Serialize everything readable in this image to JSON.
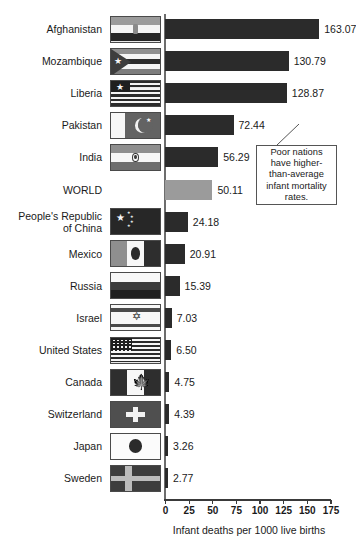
{
  "chart_data": {
    "type": "bar",
    "orientation": "horizontal",
    "title": "",
    "xlabel": "Infant deaths per 1000 live births",
    "ylabel": "",
    "xlim": [
      0,
      175
    ],
    "xticks": [
      0,
      25,
      50,
      75,
      100,
      125,
      150,
      175
    ],
    "grid": false,
    "legend": false,
    "categories": [
      "Afghanistan",
      "Mozambique",
      "Liberia",
      "Pakistan",
      "India",
      "WORLD",
      "People's Republic\nof China",
      "Mexico",
      "Russia",
      "Israel",
      "United States",
      "Canada",
      "Switzerland",
      "Japan",
      "Sweden"
    ],
    "values": [
      163.07,
      130.79,
      128.87,
      72.44,
      56.29,
      50.11,
      24.18,
      20.91,
      15.39,
      7.03,
      6.5,
      4.75,
      4.39,
      3.26,
      2.77
    ],
    "value_labels": [
      "163.07",
      "130.79",
      "128.87",
      "72.44",
      "56.29",
      "50.11",
      "24.18",
      "20.91",
      "15.39",
      "7.03",
      "6.50",
      "4.75",
      "4.39",
      "3.26",
      "2.77"
    ],
    "highlight_index": 5,
    "highlight_note": "WORLD average row drawn in lighter gray",
    "annotations": [
      {
        "text": "Poor nations have higher-than-average infant mortality rates.",
        "lines": [
          "Poor nations",
          "have higher-",
          "than-average",
          "infant mortality",
          "rates."
        ]
      }
    ],
    "colors": {
      "bar": "#2b2b2b",
      "world_bar": "#9b9b9b",
      "axis": "#3a3a3a",
      "text": "#1a1a1a",
      "background": "#ffffff"
    }
  },
  "rows": [
    {
      "label": "Afghanistan",
      "value_label": "163.07",
      "value": 163.07,
      "flag": "flag-afghanistan",
      "has_flag": true
    },
    {
      "label": "Mozambique",
      "value_label": "130.79",
      "value": 130.79,
      "flag": "flag-mozambique",
      "has_flag": true
    },
    {
      "label": "Liberia",
      "value_label": "128.87",
      "value": 128.87,
      "flag": "flag-liberia",
      "has_flag": true
    },
    {
      "label": "Pakistan",
      "value_label": "72.44",
      "value": 72.44,
      "flag": "flag-pakistan",
      "has_flag": true
    },
    {
      "label": "India",
      "value_label": "56.29",
      "value": 56.29,
      "flag": "flag-india",
      "has_flag": true
    },
    {
      "label": "WORLD",
      "value_label": "50.11",
      "value": 50.11,
      "flag": "",
      "has_flag": false
    },
    {
      "label": "People's Republic\nof China",
      "value_label": "24.18",
      "value": 24.18,
      "flag": "flag-china",
      "has_flag": true
    },
    {
      "label": "Mexico",
      "value_label": "20.91",
      "value": 20.91,
      "flag": "flag-mexico",
      "has_flag": true
    },
    {
      "label": "Russia",
      "value_label": "15.39",
      "value": 15.39,
      "flag": "flag-russia",
      "has_flag": true
    },
    {
      "label": "Israel",
      "value_label": "7.03",
      "value": 7.03,
      "flag": "flag-israel",
      "has_flag": true
    },
    {
      "label": "United States",
      "value_label": "6.50",
      "value": 6.5,
      "flag": "flag-united-states",
      "has_flag": true
    },
    {
      "label": "Canada",
      "value_label": "4.75",
      "value": 4.75,
      "flag": "flag-canada",
      "has_flag": true
    },
    {
      "label": "Switzerland",
      "value_label": "4.39",
      "value": 4.39,
      "flag": "flag-switzerland",
      "has_flag": true
    },
    {
      "label": "Japan",
      "value_label": "3.26",
      "value": 3.26,
      "flag": "flag-japan",
      "has_flag": true
    },
    {
      "label": "Sweden",
      "value_label": "2.77",
      "value": 2.77,
      "flag": "flag-sweden",
      "has_flag": true
    }
  ],
  "axis": {
    "ticks": [
      "0",
      "25",
      "50",
      "75",
      "100",
      "125",
      "150",
      "175"
    ],
    "title": "Infant deaths per 1000 live births"
  },
  "callout": {
    "line1": "Poor nations",
    "line2": "have higher-",
    "line3": "than-average",
    "line4": "infant mortality",
    "line5": "rates.",
    "full_text": "Poor nations have higher-than-average infant mortality rates."
  }
}
